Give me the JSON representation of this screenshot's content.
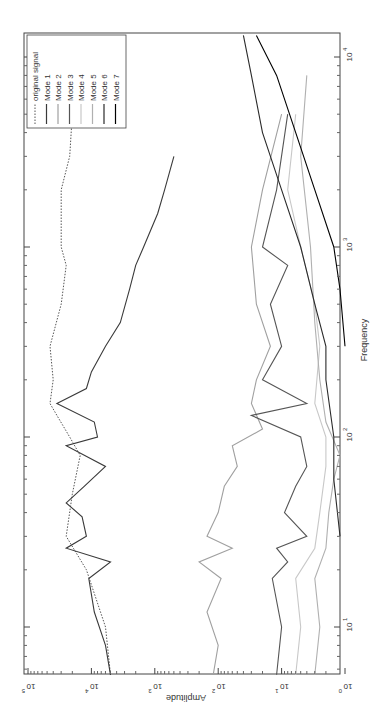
{
  "chart_data": {
    "type": "line",
    "orientation": "rotated-180-vertical (amplitude axis along bottom, decreasing left-to-right; frequency axis along right side, increasing upward)",
    "title": "",
    "xlabel": "Frequency",
    "ylabel": "Amplitude",
    "xscale": "log",
    "yscale": "log",
    "xlim": [
      5.6,
      13000
    ],
    "ylim": [
      1,
      100000
    ],
    "x_ticks": [
      {
        "value": 10,
        "label": "10",
        "exp": "1"
      },
      {
        "value": 100,
        "label": "10",
        "exp": "2"
      },
      {
        "value": 1000,
        "label": "10",
        "exp": "3"
      },
      {
        "value": 10000,
        "label": "10",
        "exp": "4"
      }
    ],
    "y_ticks": [
      {
        "value": 1,
        "label": "10",
        "exp": "0"
      },
      {
        "value": 10,
        "label": "10",
        "exp": "1"
      },
      {
        "value": 100,
        "label": "10",
        "exp": "2"
      },
      {
        "value": 1000,
        "label": "10",
        "exp": "3"
      },
      {
        "value": 10000,
        "label": "10",
        "exp": "4"
      },
      {
        "value": 100000,
        "label": "10",
        "exp": "5"
      }
    ],
    "grid": false,
    "legend_position": "top-left (rotated)",
    "legend": [
      "original signal",
      "Mode 1",
      "Mode 2",
      "Mode 3",
      "Mode 4",
      "Mode 5",
      "Mode 6",
      "Mode 7"
    ],
    "series": [
      {
        "name": "original signal",
        "style": "dotted",
        "color": "#555555",
        "x": [
          5.6,
          10,
          20,
          30,
          50,
          80,
          100,
          130,
          150,
          200,
          300,
          500,
          800,
          1000,
          2000,
          3000,
          5000,
          8000,
          13000
        ],
        "y": [
          5000,
          6000,
          12000,
          25000,
          20000,
          15000,
          22000,
          35000,
          45000,
          40000,
          45000,
          30000,
          25000,
          30000,
          30000,
          22000,
          20000,
          12000,
          8000
        ]
      },
      {
        "name": "Mode 1",
        "style": "solid",
        "color": "#3a3a3a",
        "x": [
          5.6,
          8,
          12,
          18,
          22,
          26,
          30,
          38,
          45,
          55,
          70,
          90,
          100,
          120,
          150,
          180,
          220,
          300,
          400,
          600,
          800,
          1000,
          1500,
          2000,
          3000
        ],
        "y": [
          5000,
          6000,
          9000,
          11000,
          5000,
          25000,
          12000,
          14000,
          25000,
          13000,
          6000,
          25000,
          8000,
          9000,
          35000,
          12000,
          10000,
          6000,
          3500,
          2500,
          2000,
          1500,
          900,
          700,
          500
        ]
      },
      {
        "name": "Mode 2",
        "style": "solid",
        "color": "#a0a0a0",
        "x": [
          5.6,
          8,
          12,
          18,
          22,
          26,
          30,
          40,
          55,
          70,
          90,
          110,
          150,
          200,
          300,
          500,
          1000,
          2000,
          5000
        ],
        "y": [
          120,
          100,
          150,
          90,
          200,
          60,
          150,
          100,
          80,
          50,
          60,
          20,
          30,
          25,
          15,
          25,
          30,
          20,
          10
        ]
      },
      {
        "name": "Mode 3",
        "style": "solid",
        "color": "#555555",
        "x": [
          5.6,
          10,
          18,
          22,
          26,
          30,
          40,
          55,
          70,
          100,
          130,
          150,
          200,
          300,
          500,
          800,
          1000,
          2000,
          5000
        ],
        "y": [
          12,
          10,
          14,
          8,
          12,
          4,
          9,
          6,
          4,
          5,
          30,
          4,
          20,
          10,
          15,
          8,
          20,
          12,
          8
        ]
      },
      {
        "name": "Mode 4",
        "style": "solid",
        "color": "#c8c8c8",
        "x": [
          5.6,
          10,
          18,
          26,
          40,
          70,
          100,
          150,
          300,
          500,
          1000,
          2000,
          5000
        ],
        "y": [
          6,
          5,
          6,
          3,
          2.5,
          2,
          2,
          3,
          2.5,
          3,
          5,
          8,
          6
        ]
      },
      {
        "name": "Mode 5",
        "style": "solid",
        "color": "#b0b0b0",
        "x": [
          5.6,
          10,
          18,
          26,
          40,
          60,
          80,
          120,
          200,
          400,
          1000,
          3000,
          8000
        ],
        "y": [
          3,
          2.5,
          3,
          2,
          1.8,
          1.5,
          1.2,
          2,
          2.5,
          3,
          3.5,
          5,
          4
        ]
      },
      {
        "name": "Mode 6",
        "style": "solid",
        "color": "#2a2a2a",
        "x": [
          30,
          60,
          100,
          200,
          300,
          500,
          1000,
          2000,
          4000,
          8000,
          13000
        ],
        "y": [
          1.2,
          1.5,
          1.5,
          2,
          2,
          3,
          5,
          10,
          20,
          30,
          40
        ]
      },
      {
        "name": "Mode 7",
        "style": "solid",
        "color": "#000000",
        "x": [
          300,
          600,
          1000,
          2000,
          4000,
          8000,
          13000
        ],
        "y": [
          1,
          1.2,
          1.5,
          3,
          6,
          12,
          25
        ]
      }
    ]
  }
}
